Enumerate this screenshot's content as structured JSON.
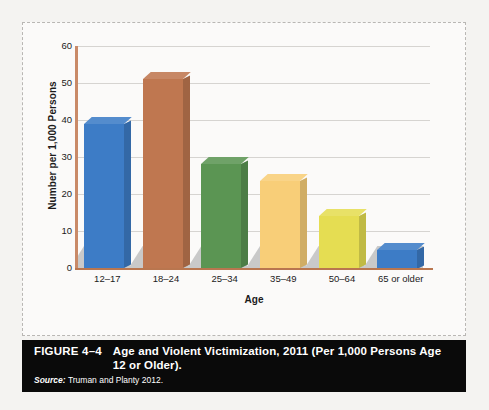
{
  "figure": {
    "number": "FIGURE 4–4",
    "title": "Age and Violent Victimization, 2011 (Per 1,000 Persons Age 12 or Older).",
    "source_label": "Source:",
    "source_text": "Truman and Planty 2012."
  },
  "colors": {
    "bar_blue": "#3d7cc6",
    "bar_brown": "#bf7750",
    "bar_green": "#5b9553",
    "bar_peach": "#f8ce78",
    "bar_yellow": "#e5dd52",
    "axis": "#b9764f",
    "axis_left": "#c98a68",
    "gridline": "#d6d4d1",
    "floor": "#c9c9c9",
    "caption_bg": "#0a0a0a",
    "page_bg": "#f4f3f1"
  },
  "chart_data": {
    "type": "bar",
    "title": "Age and Violent Victimization, 2011 (Per 1,000 Persons Age 12 or Older).",
    "xlabel": "Age",
    "ylabel": "Number per 1,000 Persons",
    "categories": [
      "12–17",
      "18–24",
      "25–34",
      "35–49",
      "50–64",
      "65 or older"
    ],
    "values": [
      39,
      51,
      28,
      23.5,
      14,
      5
    ],
    "ylim": [
      0,
      60
    ],
    "yticks": [
      0,
      10,
      20,
      30,
      40,
      50,
      60
    ],
    "ytick_labels": [
      "0",
      "10",
      "20",
      "30",
      "40",
      "50",
      "60"
    ],
    "grid": true,
    "legend": false,
    "bar_colors": [
      "#3d7cc6",
      "#bf7750",
      "#5b9553",
      "#f8ce78",
      "#e5dd52",
      "#3d7cc6"
    ],
    "style": "3d-column"
  }
}
